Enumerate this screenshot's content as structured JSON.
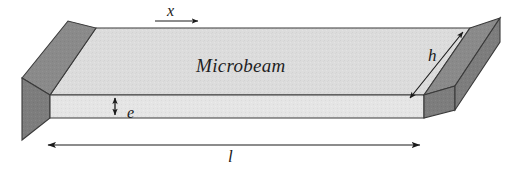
{
  "figure": {
    "body_label": "Microbeam",
    "background_color": "#ffffff"
  },
  "colors": {
    "top_face": "#dcdcdc",
    "front_band": "#e4e4e4",
    "end_face_dark": "#8a8a8a",
    "end_cap_darker": "#7b7b7b",
    "outline": "#3a3a3a",
    "arrow": "#1a1a1a",
    "text": "#1a1a1a"
  },
  "dimensions": [
    {
      "id": "x-axis",
      "symbol": "x",
      "kind": "axis-arrow",
      "direction": "right",
      "arrowheads": "single",
      "description": "Longitudinal coordinate axis along the beam length"
    },
    {
      "id": "width",
      "symbol": "h",
      "kind": "dimension-arrow",
      "direction": "diagonal",
      "arrowheads": "double",
      "description": "Beam width measured across the top face at the right end"
    },
    {
      "id": "thickness",
      "symbol": "e",
      "kind": "dimension-arrow",
      "direction": "vertical",
      "arrowheads": "double",
      "description": "Beam thickness measured on the front edge band"
    },
    {
      "id": "length",
      "symbol": "l",
      "kind": "dimension-arrow",
      "direction": "horizontal",
      "arrowheads": "double",
      "description": "Overall beam length measured below the solid"
    }
  ]
}
